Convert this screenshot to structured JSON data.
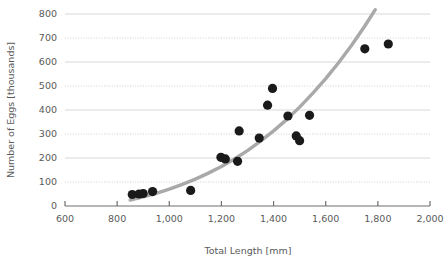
{
  "chart_data": {
    "type": "scatter",
    "title": "",
    "xlabel": "Total Length [mm]",
    "ylabel": "Number of Eggs [thousands]",
    "xlim": [
      600,
      2000
    ],
    "ylim": [
      0,
      800
    ],
    "xticks": [
      600,
      800,
      1000,
      1200,
      1400,
      1600,
      1800,
      2000
    ],
    "xtick_labels": [
      "600",
      "800",
      "1,000",
      "1,200",
      "1,400",
      "1,600",
      "1,800",
      "2,000"
    ],
    "yticks": [
      0,
      100,
      200,
      300,
      400,
      500,
      600,
      700,
      800
    ],
    "ytick_labels": [
      "0",
      "100",
      "200",
      "300",
      "400",
      "500",
      "600",
      "700",
      "800"
    ],
    "grid": true,
    "grid_axis": "y",
    "legend": "none",
    "marker_color": "#1a1a1a",
    "marker_size": 4.6,
    "series": [
      {
        "name": "observations",
        "points": [
          [
            858,
            48
          ],
          [
            884,
            50
          ],
          [
            900,
            52
          ],
          [
            936,
            60
          ],
          [
            1082,
            65
          ],
          [
            1198,
            203
          ],
          [
            1215,
            196
          ],
          [
            1262,
            186
          ],
          [
            1268,
            313
          ],
          [
            1345,
            283
          ],
          [
            1377,
            420
          ],
          [
            1396,
            490
          ],
          [
            1455,
            375
          ],
          [
            1487,
            292
          ],
          [
            1500,
            272
          ],
          [
            1538,
            378
          ],
          [
            1750,
            655
          ],
          [
            1840,
            675
          ]
        ]
      }
    ],
    "trend": {
      "name": "fitted-curve",
      "color": "#a9a9a9",
      "width": 3.4,
      "points": [
        [
          850,
          25
        ],
        [
          900,
          38
        ],
        [
          950,
          53
        ],
        [
          1000,
          70
        ],
        [
          1050,
          90
        ],
        [
          1100,
          112
        ],
        [
          1150,
          137
        ],
        [
          1200,
          165
        ],
        [
          1250,
          196
        ],
        [
          1300,
          231
        ],
        [
          1350,
          270
        ],
        [
          1400,
          313
        ],
        [
          1450,
          360
        ],
        [
          1500,
          412
        ],
        [
          1550,
          469
        ],
        [
          1600,
          531
        ],
        [
          1650,
          598
        ],
        [
          1700,
          671
        ],
        [
          1750,
          750
        ],
        [
          1790,
          818
        ]
      ]
    }
  }
}
